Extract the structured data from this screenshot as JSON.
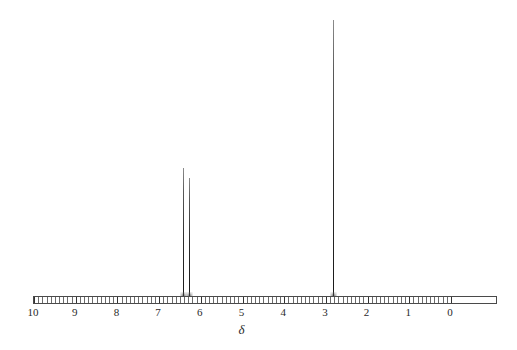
{
  "figure": {
    "type": "nmr-spectrum",
    "background_color": "#ffffff",
    "trace_color": "#1a1a1a",
    "axis_color": "#4a4a4a"
  },
  "axis": {
    "label": "δ",
    "label_name": "delta-symbol",
    "orientation": "horizontal-reversed",
    "min": 0,
    "max": 10,
    "major_tick_step": 1,
    "minor_tick_step": 0.1,
    "tick_labels": [
      "10",
      "9",
      "8",
      "7",
      "6",
      "5",
      "4",
      "3",
      "2",
      "1",
      "0"
    ],
    "tick_values": [
      10,
      9,
      8,
      7,
      6,
      5,
      4,
      3,
      2,
      1,
      0
    ],
    "left_px": 33,
    "right_px": 497,
    "zero_px": 450,
    "px_per_ppm": 46.4,
    "baseline_y": 296,
    "ruler_height": 8
  },
  "chart_data": {
    "type": "line",
    "title": "",
    "subtitle": "",
    "xlabel": "δ",
    "ylabel": "",
    "xlim": [
      10,
      0
    ],
    "ylim": [
      0,
      300
    ],
    "grid": false,
    "legend": false,
    "x_axis_reversed": true,
    "peaks": [
      {
        "id": "peak-aromatic-a",
        "shift": 6.4,
        "height": 128,
        "width_px": 1,
        "label": ""
      },
      {
        "id": "peak-aromatic-b",
        "shift": 6.25,
        "height": 118,
        "width_px": 1,
        "label": ""
      },
      {
        "id": "peak-methyl",
        "shift": 2.81,
        "height": 276,
        "width_px": 1,
        "label": ""
      }
    ],
    "x": [
      6.4,
      6.25,
      2.81
    ],
    "values": [
      128,
      118,
      276
    ],
    "categories": [
      "6.40",
      "6.25",
      "2.81"
    ]
  }
}
